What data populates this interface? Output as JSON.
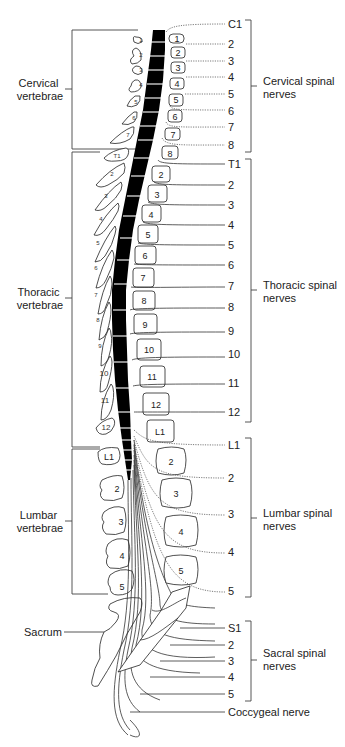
{
  "diagram": {
    "left_labels": {
      "cervical": [
        "Cervical",
        "vertebrae"
      ],
      "thoracic": [
        "Thoracic",
        "vertebrae"
      ],
      "lumbar": [
        "Lumbar",
        "vertebrae"
      ],
      "sacrum": "Sacrum"
    },
    "right_labels": {
      "cervical": [
        "Cervical spinal",
        "nerves"
      ],
      "thoracic": [
        "Thoracic spinal",
        "nerves"
      ],
      "lumbar": [
        "Lumbar spinal",
        "nerves"
      ],
      "sacral": [
        "Sacral spinal",
        "nerves"
      ],
      "coccygeal": "Coccygeal nerve"
    },
    "cervical_nerves": [
      "C1",
      "2",
      "3",
      "4",
      "5",
      "6",
      "7",
      "8"
    ],
    "thoracic_nerves": [
      "T1",
      "2",
      "3",
      "4",
      "5",
      "6",
      "7",
      "8",
      "9",
      "10",
      "11",
      "12"
    ],
    "lumbar_nerves": [
      "L1",
      "2",
      "3",
      "4",
      "5"
    ],
    "sacral_nerves": [
      "S1",
      "2",
      "3",
      "4",
      "5"
    ],
    "cervical_vertebra_bodies": [
      "1",
      "2",
      "3",
      "4",
      "5",
      "6",
      "7",
      "8"
    ],
    "thoracic_vertebra_bodies": [
      "2",
      "3",
      "4",
      "5",
      "6",
      "7",
      "8",
      "9",
      "10",
      "11",
      "12",
      "L1"
    ],
    "lumbar_vertebra_bodies": [
      "2",
      "3",
      "4",
      "5"
    ],
    "cervical_spinous": [
      "1",
      "2",
      "3",
      "4",
      "5",
      "6",
      "7"
    ],
    "thoracic_spinous": [
      "T1",
      "2",
      "3",
      "4",
      "5",
      "6",
      "7",
      "8",
      "9",
      "10",
      "11",
      "12"
    ],
    "lumbar_spinous": [
      "L1",
      "2",
      "3",
      "4",
      "5"
    ]
  }
}
